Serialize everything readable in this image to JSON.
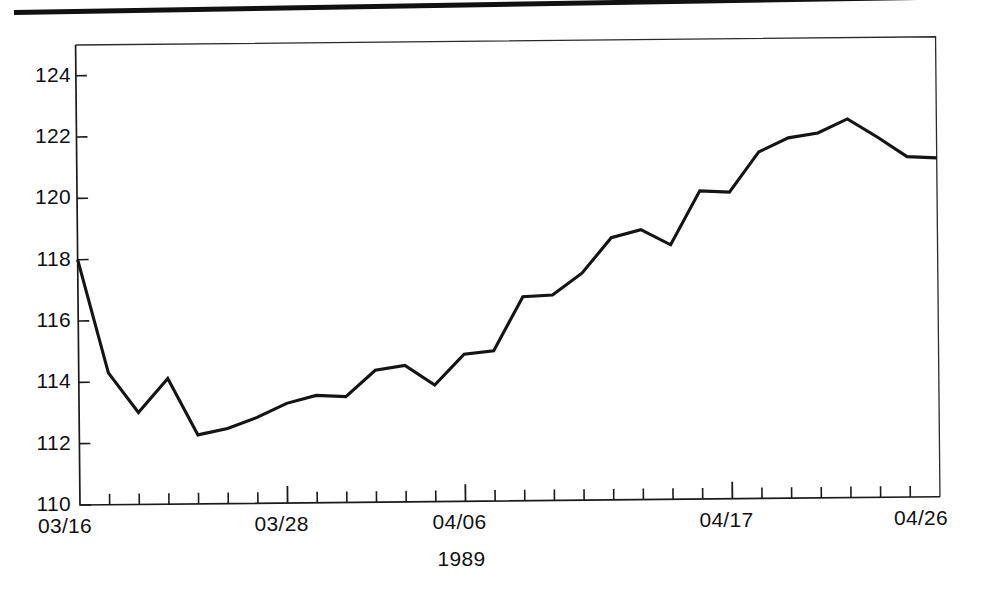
{
  "figure": {
    "name": "time-series-line-chart",
    "has_top_rule": true,
    "line_color": "#141414",
    "background_color": "#ffffff"
  },
  "chart_data": {
    "type": "line",
    "title": "",
    "subtitle": "",
    "xlabel": "1989",
    "ylabel": "",
    "ylim": [
      110,
      125
    ],
    "xlim": [
      0,
      29
    ],
    "grid": false,
    "legend": null,
    "ytick_labels": [
      "110",
      "112",
      "114",
      "116",
      "118",
      "120",
      "122",
      "124"
    ],
    "ytick_values": [
      110,
      112,
      114,
      116,
      118,
      120,
      122,
      124
    ],
    "xtick_labels": [
      "03/16",
      "03/28",
      "04/06",
      "04/17",
      "04/26"
    ],
    "xtick_indices": [
      0,
      7,
      13,
      22,
      29
    ],
    "xtick_minor_count": 29,
    "annotations": [],
    "series": [
      {
        "name": "value",
        "x": [
          0,
          1,
          2,
          3,
          4,
          5,
          6,
          7,
          8,
          9,
          10,
          11,
          12,
          13,
          14,
          15,
          16,
          17,
          18,
          19,
          20,
          21,
          22,
          23,
          24,
          25,
          26,
          27,
          28,
          29
        ],
        "values": [
          118.0,
          114.3,
          113.0,
          114.1,
          112.25,
          112.45,
          112.8,
          113.25,
          113.5,
          113.45,
          114.3,
          114.45,
          113.8,
          114.8,
          114.9,
          116.65,
          116.7,
          117.4,
          118.55,
          118.8,
          118.3,
          120.05,
          120.0,
          121.3,
          121.75,
          121.9,
          122.35,
          121.75,
          121.1,
          121.05
        ]
      }
    ]
  },
  "axis": {
    "x_tick_label_positions": [
      80,
      292,
      504,
      730,
      940
    ],
    "y_tick_label_positions": [
      501,
      442,
      383,
      323,
      263,
      203,
      143,
      83
    ]
  }
}
